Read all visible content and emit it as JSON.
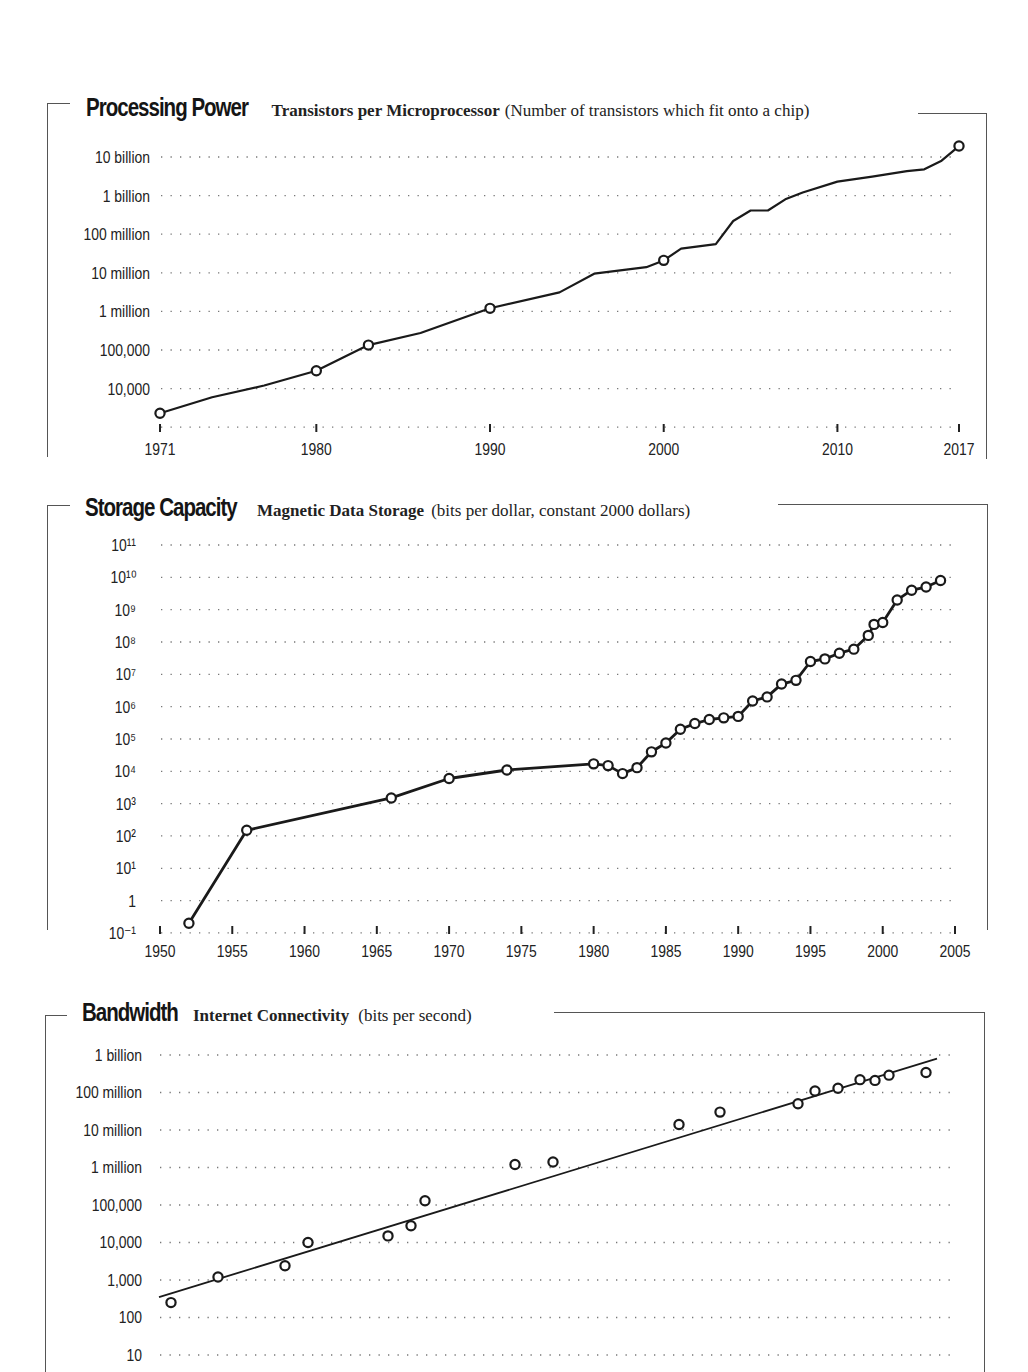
{
  "charts": {
    "processing": {
      "title": "Processing Power",
      "subtitle_bold": "Transistors per Microprocessor",
      "subtitle_note": "(Number of transistors which fit onto a chip)",
      "y_ticks": [
        "10 billion",
        "1 billion",
        "100 million",
        "10 million",
        "1 million",
        "100,000",
        "10,000"
      ],
      "x_ticks": [
        "1971",
        "1980",
        "1990",
        "2000",
        "2010",
        "2017"
      ]
    },
    "storage": {
      "title": "Storage Capacity",
      "subtitle_bold": "Magnetic Data Storage",
      "subtitle_note": "(bits per dollar, constant 2000 dollars)",
      "y_ticks": [
        "10¹¹",
        "10¹⁰",
        "10⁹",
        "10⁸",
        "10⁷",
        "10⁶",
        "10⁵",
        "10⁴",
        "10³",
        "10²",
        "10¹",
        "1",
        "10⁻¹"
      ],
      "x_ticks": [
        "1950",
        "1955",
        "1960",
        "1965",
        "1970",
        "1975",
        "1980",
        "1985",
        "1990",
        "1995",
        "2000",
        "2005"
      ]
    },
    "bandwidth": {
      "title": "Bandwidth",
      "subtitle_bold": "Internet Connectivity",
      "subtitle_note": "(bits per second)",
      "y_ticks": [
        "1 billion",
        "100 million",
        "10 million",
        "1 million",
        "100,000",
        "10,000",
        "1,000",
        "100",
        "10"
      ]
    }
  },
  "chart_data": [
    {
      "type": "line",
      "title": "Processing Power — Transistors per Microprocessor (Number of transistors which fit onto a chip)",
      "xlabel": "Year",
      "ylabel": "Transistors (log scale)",
      "yscale": "log",
      "ylim": [
        1000,
        10000000000
      ],
      "x_ticks": [
        1971,
        1980,
        1990,
        2000,
        2010,
        2017
      ],
      "y_ticks": [
        "10 billion",
        "1 billion",
        "100 million",
        "10 million",
        "1 million",
        "100,000",
        "10,000"
      ],
      "grid": "horizontal dotted",
      "series": [
        {
          "name": "Transistors per microprocessor",
          "x": [
            1971,
            1974,
            1977,
            1980,
            1983,
            1986,
            1990,
            1994,
            1996,
            1999,
            2000,
            2001,
            2003,
            2004,
            2005,
            2006,
            2007,
            2008,
            2010,
            2012,
            2014,
            2015,
            2016,
            2017
          ],
          "y": [
            2300,
            6000,
            12000,
            29000,
            134000,
            275000,
            1200000,
            3100000,
            9500000,
            14000000,
            21000000,
            42000000,
            55000000,
            220000000,
            410000000,
            410000000,
            800000000,
            1200000000,
            2300000000,
            3100000000,
            4300000000,
            4800000000,
            8000000000,
            19200000000
          ],
          "marked_points": [
            [
              1971,
              2300
            ],
            [
              1980,
              29000
            ],
            [
              1983,
              134000
            ],
            [
              1990,
              1200000
            ],
            [
              2000,
              21000000
            ],
            [
              2017,
              19200000000
            ]
          ]
        }
      ]
    },
    {
      "type": "line",
      "title": "Storage Capacity — Magnetic Data Storage (bits per dollar, constant 2000 dollars)",
      "xlabel": "Year",
      "ylabel": "Bits per dollar (log scale)",
      "yscale": "log",
      "ylim": [
        0.1,
        100000000000
      ],
      "x_ticks": [
        1950,
        1955,
        1960,
        1965,
        1970,
        1975,
        1980,
        1985,
        1990,
        1995,
        2000,
        2005
      ],
      "y_ticks": [
        "10^11",
        "10^10",
        "10^9",
        "10^8",
        "10^7",
        "10^6",
        "10^5",
        "10^4",
        "10^3",
        "10^2",
        "10^1",
        "1",
        "10^-1"
      ],
      "grid": "horizontal dotted",
      "series": [
        {
          "name": "Bits per dollar",
          "x": [
            1952,
            1956,
            1966,
            1970,
            1974,
            1980,
            1981,
            1982,
            1983,
            1984,
            1985,
            1986,
            1987,
            1988,
            1989,
            1990,
            1991,
            1992,
            1993,
            1994,
            1995,
            1996,
            1997,
            1998,
            1999,
            1999.4,
            2000,
            2001,
            2002,
            2003,
            2004
          ],
          "y": [
            0.2,
            150,
            1500,
            6000,
            11000,
            17000,
            15000,
            8500,
            13000,
            40000,
            75000,
            200000,
            300000,
            400000,
            450000,
            500000,
            1500000,
            2000000,
            5000000,
            6500000,
            25000000,
            30000000,
            45000000,
            60000000,
            160000000,
            350000000,
            400000000,
            2000000000,
            4000000000,
            5000000000,
            8000000000
          ]
        }
      ]
    },
    {
      "type": "scatter",
      "title": "Bandwidth — Internet Connectivity (bits per second)",
      "ylabel": "Bits per second (log scale)",
      "yscale": "log",
      "ylim": [
        10,
        1000000000
      ],
      "y_ticks": [
        "1 billion",
        "100 million",
        "10 million",
        "1 million",
        "100,000",
        "10,000",
        "1,000",
        "100",
        "10"
      ],
      "grid": "horizontal dotted",
      "notes": "x-axis labels not visible in the screenshot; points include a linear (log-scale) trend line",
      "series": [
        {
          "name": "Observations (approx. bps)",
          "values": [
            250,
            1200,
            2400,
            10000,
            15000,
            28000,
            130000,
            1200000,
            1400000,
            14000000,
            30000000,
            50000000,
            110000000,
            130000000,
            220000000,
            210000000,
            290000000,
            340000000
          ]
        },
        {
          "name": "Trend line",
          "type": "line",
          "start": 350,
          "end": 800000000
        }
      ]
    }
  ]
}
